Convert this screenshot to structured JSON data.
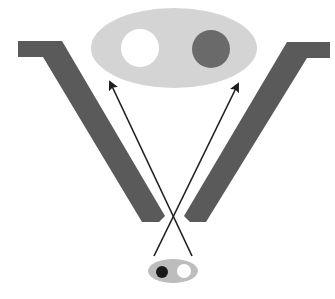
{
  "diagram": {
    "colors": {
      "background": "#ffffff",
      "bars": "#5a5a5a",
      "large_oval": "#d4d4d4",
      "small_oval": "#bdbdbd",
      "white_circle": "#ffffff",
      "dark_circle": "#6a6a6a",
      "black_dot": "#1a1a1a",
      "arrows": "#1e1e1e"
    },
    "large_oval": {
      "cx": 174,
      "cy": 48,
      "rx": 83,
      "ry": 40,
      "circles": [
        {
          "name": "white-circle",
          "cx": 140,
          "cy": 48,
          "r": 19
        },
        {
          "name": "dark-circle",
          "cx": 211,
          "cy": 49,
          "r": 19
        }
      ]
    },
    "small_oval": {
      "cx": 173,
      "cy": 271,
      "rx": 25,
      "ry": 12,
      "dots": [
        {
          "name": "black-dot",
          "cx": 162,
          "cy": 272,
          "r": 6
        },
        {
          "name": "white-dot",
          "cx": 184,
          "cy": 271,
          "r": 7
        }
      ]
    },
    "arrows": [
      {
        "from": [
          192,
          256
        ],
        "to": [
          109,
          80
        ]
      },
      {
        "from": [
          154,
          256
        ],
        "to": [
          239,
          82
        ]
      }
    ]
  }
}
